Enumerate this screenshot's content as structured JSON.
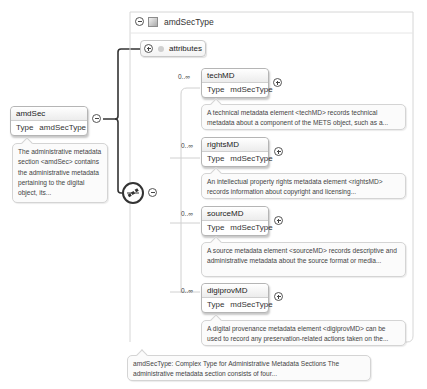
{
  "root_element": {
    "name": "amdSec",
    "type_label": "Type",
    "type_value": "amdSecType",
    "documentation": "The administrative metadata section <amdSec> contains the administrative metadata pertaining to the digital object, its..."
  },
  "complex_type": {
    "name": "amdSecType",
    "attributes_label": "attributes",
    "documentation": "amdSecType: Complex Type for Administrative Metadata Sections The administrative metadata section consists of four..."
  },
  "children": [
    {
      "cardinality": "0..∞",
      "name": "techMD",
      "type_label": "Type",
      "type_value": "mdSecType",
      "documentation": "A technical metadata element <techMD> records technical metadata about a component of the METS object, such as a..."
    },
    {
      "cardinality": "0..∞",
      "name": "rightsMD",
      "type_label": "Type",
      "type_value": "mdSecType",
      "documentation": "An intellectual property rights metadata element <rightsMD> records information about copyright and licensing..."
    },
    {
      "cardinality": "0..∞",
      "name": "sourceMD",
      "type_label": "Type",
      "type_value": "mdSecType",
      "documentation": "A source metadata element <sourceMD> records descriptive and administrative metadata about the source format or media..."
    },
    {
      "cardinality": "0..∞",
      "name": "digiprovMD",
      "type_label": "Type",
      "type_value": "mdSecType",
      "documentation": "A digital provenance metadata element <digiprovMD> can be used to record any preservation-related actions taken on the..."
    }
  ],
  "icons": {
    "collapse": "minus-circle-icon",
    "expand": "plus-circle-icon",
    "type": "complex-type-icon",
    "attribute": "attribute-icon",
    "sequence": "sequence-compositor-icon"
  }
}
